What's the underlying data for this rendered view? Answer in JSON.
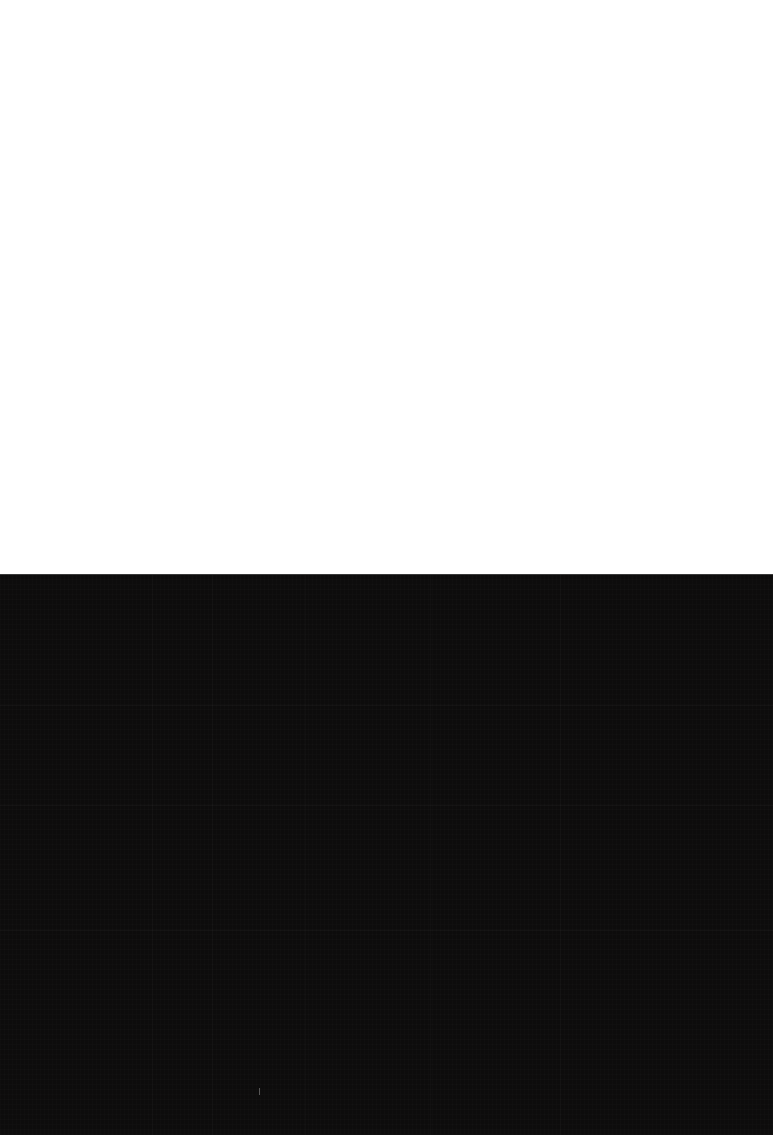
{
  "capture": {
    "state_label": "",
    "width": 773,
    "height": 1135
  },
  "regions": {
    "top": {
      "name": "blank-white-pane",
      "label": "",
      "color": "#ffffff",
      "x": 0,
      "y": 0,
      "width": 773,
      "height": 575
    },
    "bottom": {
      "name": "blank-dark-pane",
      "label": "",
      "color": "#0d0c0c",
      "x": 0,
      "y": 575,
      "width": 773,
      "height": 560
    },
    "divider": {
      "name": "pane-divider",
      "label": "",
      "color": "#3a3a3a",
      "y": 574
    }
  },
  "artifacts": {
    "bands": [
      {
        "label": "",
        "offset_y": 130,
        "color": "#ffffff"
      },
      {
        "label": "",
        "offset_y": 230,
        "color": "#ffffff"
      },
      {
        "label": "",
        "offset_y": 355,
        "color": "#ffffff"
      }
    ],
    "seams": [
      {
        "label": "",
        "offset_x": 152
      },
      {
        "label": "",
        "offset_x": 212
      },
      {
        "label": "",
        "offset_x": 305
      },
      {
        "label": "",
        "offset_x": 430
      },
      {
        "label": "",
        "offset_x": 560
      }
    ],
    "speck": {
      "label": "",
      "offset_x": 259,
      "offset_y": 513,
      "color": "#ffffff"
    }
  }
}
